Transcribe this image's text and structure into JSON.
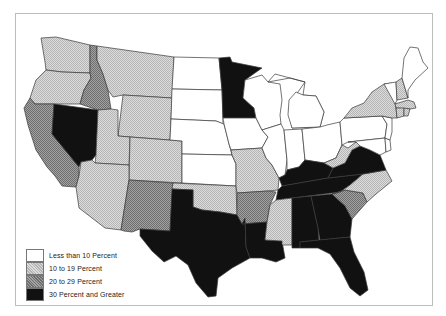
{
  "map": {
    "type": "choropleth",
    "region": "Contiguous United States",
    "categories": [
      {
        "id": "c1",
        "label": "Less than 10 Percent",
        "fill": "url(#p-white)"
      },
      {
        "id": "c2",
        "label": "10 to 19 Percent",
        "fill": "url(#p-light)"
      },
      {
        "id": "c3",
        "label": "20 to 29 Percent",
        "fill": "url(#p-dark)"
      },
      {
        "id": "c4",
        "label": "30 Percent and Greater",
        "fill": "#111111"
      }
    ],
    "states": {
      "WA": "c2",
      "OR": "c2",
      "CA": "c3",
      "NV": "c4",
      "ID": "c3",
      "MT": "c2",
      "WY": "c2",
      "UT": "c2",
      "CO": "c2",
      "AZ": "c2",
      "NM": "c3",
      "ND": "c1",
      "SD": "c1",
      "NE": "c1",
      "KS": "c1",
      "OK": "c2",
      "TX": "c4",
      "MN": "c4",
      "IA": "c1",
      "MO": "c2",
      "AR": "c3",
      "LA": "c4",
      "WI": "c1",
      "IL": "c1",
      "MI": "c1",
      "IN": "c1",
      "OH": "c1",
      "KY": "c4",
      "TN": "c4",
      "MS": "c2",
      "AL": "c4",
      "GA": "c4",
      "FL": "c4",
      "SC": "c3",
      "NC": "c2",
      "VA": "c4",
      "WV": "c2",
      "PA": "c1",
      "NY": "c2",
      "VT": "c1",
      "NH": "c2",
      "ME": "c1",
      "MA": "c2",
      "RI": "c2",
      "CT": "c2",
      "NJ": "c1",
      "DE": "c1",
      "MD": "c1"
    }
  },
  "legend": {
    "items": [
      {
        "label": "Less than 10 Percent",
        "swatch": "white"
      },
      {
        "label": "10 to 19 Percent",
        "swatch": "light"
      },
      {
        "label": "20 to 29 Percent",
        "swatch": "dark"
      },
      {
        "label": "30 Percent and Greater",
        "swatch": "black"
      }
    ]
  },
  "colors": {
    "frame": "#bdbdbd",
    "border": "#3a3a3a",
    "black": "#111111",
    "light_hatch": "#c9c9c9",
    "dark_hatch": "#8a8a8a"
  }
}
